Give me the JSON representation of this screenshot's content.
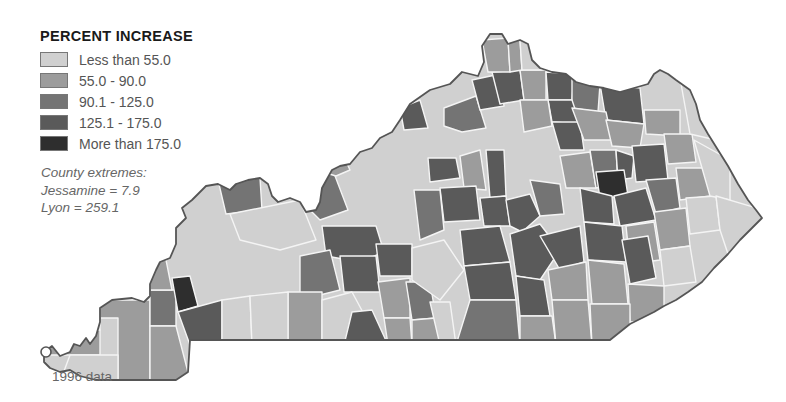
{
  "legend": {
    "title": "PERCENT INCREASE",
    "items": [
      {
        "label": "Less than 55.0",
        "color": "#d0d0d0"
      },
      {
        "label": "55.0 - 90.0",
        "color": "#9c9c9c"
      },
      {
        "label": "90.1 - 125.0",
        "color": "#747474"
      },
      {
        "label": "125.1 - 175.0",
        "color": "#5a5a5a"
      },
      {
        "label": "More than 175.0",
        "color": "#2e2e2e"
      }
    ]
  },
  "extremes": {
    "heading": "County extremes:",
    "min": "Jessamine = 7.9",
    "max": "Lyon = 259.1"
  },
  "source_note": "1996 data",
  "map": {
    "region": "Kentucky",
    "counties_by_class": {
      "lt55": "#d0d0d0",
      "55_90": "#9c9c9c",
      "90_125": "#747474",
      "125_175": "#5a5a5a",
      "gt175": "#2e2e2e"
    }
  }
}
